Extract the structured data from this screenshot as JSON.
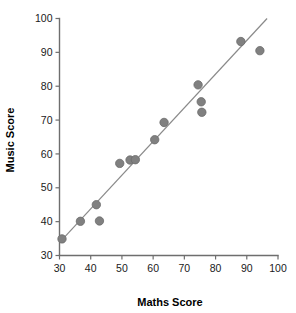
{
  "chart_data": {
    "type": "scatter",
    "title": "",
    "xlabel": "Maths Score",
    "ylabel": "Music Score",
    "xlim": [
      30,
      100
    ],
    "ylim": [
      30,
      100
    ],
    "xticks": [
      30,
      40,
      50,
      60,
      70,
      80,
      90,
      100
    ],
    "yticks": [
      30,
      40,
      50,
      60,
      70,
      80,
      90,
      100
    ],
    "xtick_labels": [
      "30",
      "40",
      "50",
      "60",
      "70",
      "80",
      "90",
      "100"
    ],
    "ytick_labels": [
      "30",
      "40",
      "50",
      "60",
      "70",
      "80",
      "90",
      "100"
    ],
    "grid": false,
    "legend": null,
    "marker_color": "#808080",
    "line_color": "#8a8a8a",
    "axis_color": "#6e6e6e",
    "points": [
      {
        "x": 30.8,
        "y": 34.9
      },
      {
        "x": 36.7,
        "y": 40.1
      },
      {
        "x": 41.8,
        "y": 45.0
      },
      {
        "x": 42.8,
        "y": 40.2
      },
      {
        "x": 49.3,
        "y": 57.2
      },
      {
        "x": 52.6,
        "y": 58.2
      },
      {
        "x": 54.3,
        "y": 58.3
      },
      {
        "x": 60.5,
        "y": 64.2
      },
      {
        "x": 63.5,
        "y": 69.3
      },
      {
        "x": 74.4,
        "y": 80.4
      },
      {
        "x": 75.4,
        "y": 75.4
      },
      {
        "x": 75.6,
        "y": 72.3
      },
      {
        "x": 88.1,
        "y": 93.2
      },
      {
        "x": 94.2,
        "y": 90.5
      }
    ],
    "trendline": {
      "x_start": 30.2,
      "y_start": 34.0,
      "x_end": 96.5,
      "y_end": 100.0
    }
  },
  "axes": {
    "x_axis_name": "maths-score-axis",
    "y_axis_name": "music-score-axis"
  }
}
